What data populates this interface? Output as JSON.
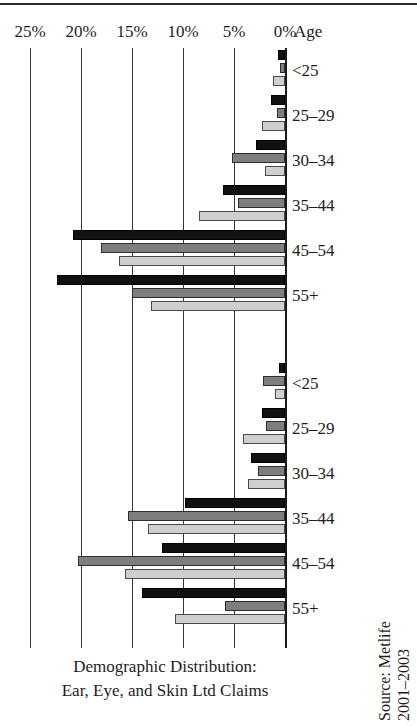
{
  "figure": {
    "caption_lines": [
      "Demographic Distribution:",
      "Ear, Eye, and Skin Ltd Claims"
    ],
    "source_lines": [
      "Source: Metlife",
      "2001–2003"
    ],
    "age_header": "Age"
  },
  "chart_data": {
    "type": "bar",
    "orientation": "horizontal-reversed",
    "title": "Demographic Distribution: Ear, Eye, and Skin Ltd Claims",
    "xlabel": "",
    "ylabel": "Age",
    "xlim": [
      0,
      25
    ],
    "xticks": [
      25,
      20,
      15,
      10,
      5,
      0
    ],
    "xtick_labels": [
      "25%",
      "20%",
      "15%",
      "10%",
      "5%",
      "0%"
    ],
    "grid": true,
    "legend": "none",
    "axis_direction": "values increase to the left from 0% at right",
    "panels": [
      {
        "name": "upper-panel",
        "categories": [
          "<25",
          "25–29",
          "30–34",
          "35–44",
          "45–54",
          "55+"
        ],
        "series": [
          {
            "name": "series-1",
            "fill": "black",
            "values": [
              0.7,
              1.4,
              2.8,
              6.1,
              20.8,
              22.4
            ]
          },
          {
            "name": "series-2",
            "fill": "dark-gray",
            "values": [
              0.5,
              0.8,
              5.2,
              4.6,
              18.0,
              15.0
            ]
          },
          {
            "name": "series-3",
            "fill": "light-gray",
            "values": [
              1.2,
              2.3,
              2.0,
              8.4,
              16.3,
              13.1
            ]
          }
        ]
      },
      {
        "name": "lower-panel",
        "categories": [
          "<25",
          "25–29",
          "30–34",
          "35–44",
          "45–54",
          "55+"
        ],
        "series": [
          {
            "name": "series-1",
            "fill": "black",
            "values": [
              0.6,
              2.3,
              3.3,
              9.8,
              12.1,
              14.0
            ]
          },
          {
            "name": "series-2",
            "fill": "dark-gray",
            "values": [
              2.2,
              1.9,
              2.6,
              15.4,
              20.3,
              5.9
            ]
          },
          {
            "name": "series-3",
            "fill": "light-gray",
            "values": [
              1.0,
              4.1,
              3.6,
              13.4,
              15.7,
              10.8
            ]
          }
        ]
      }
    ]
  },
  "axis": {
    "ticks": [
      {
        "label": "25%",
        "value": 25
      },
      {
        "label": "20%",
        "value": 20
      },
      {
        "label": "15%",
        "value": 15
      },
      {
        "label": "10%",
        "value": 10
      },
      {
        "label": "5%",
        "value": 5
      },
      {
        "label": "0%",
        "value": 0
      }
    ]
  }
}
